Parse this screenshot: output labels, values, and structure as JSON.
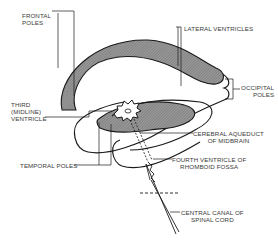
{
  "diagram": {
    "type": "anatomical line drawing",
    "fill_color": "#8a8a8a",
    "line_color": "#1a1a1a",
    "labels": {
      "frontal_poles": [
        "FRONTAL",
        "POLES"
      ],
      "lateral_ventricles": "LATERAL VENTRICLES",
      "occipital_poles": [
        "OCCIPITAL",
        "POLES"
      ],
      "third_ventricle": [
        "THIRD",
        "(MIDLINE)",
        "VENTRICLE"
      ],
      "cerebral_aqueduct": [
        "CEREBRAL AQUEDUCT",
        "OF MIDBRAIN"
      ],
      "temporal_poles": "TEMPORAL POLES",
      "fourth_ventricle": [
        "FOURTH VENTRICLE OF",
        "RHOMBOID FOSSA"
      ],
      "central_canal": [
        "CENTRAL CANAL OF",
        "SPINAL CORD"
      ]
    }
  }
}
